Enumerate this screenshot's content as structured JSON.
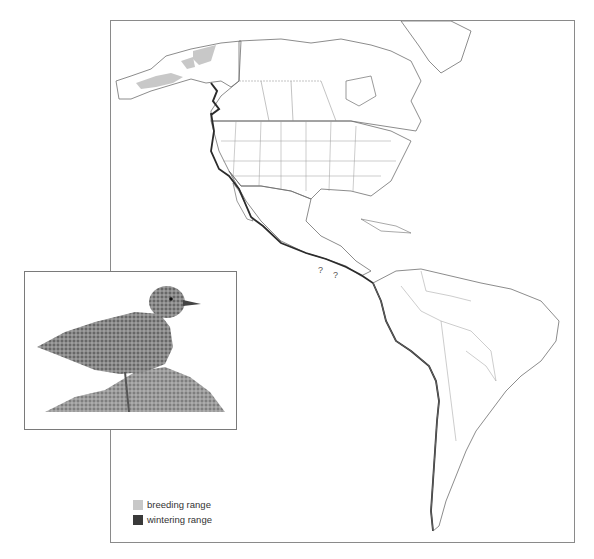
{
  "figure": {
    "type": "species range map",
    "header_fragment": "",
    "map": {
      "region": "North and South America",
      "uncertain_markers": [
        "?",
        "?"
      ],
      "colors": {
        "land_outline": "#6f6f6f",
        "political_border": "#9a9a9a",
        "breeding_fill": "#c8c8c8",
        "wintering_line": "#2b2b2b",
        "frame": "#8a8a8a"
      }
    },
    "inset": {
      "subject": "shorebird illustration (surfbird) standing on rock"
    },
    "legend": {
      "items": [
        {
          "label": "breeding range",
          "color": "#c8c8c8"
        },
        {
          "label": "wintering range",
          "color": "#3a3a3a"
        }
      ]
    }
  }
}
